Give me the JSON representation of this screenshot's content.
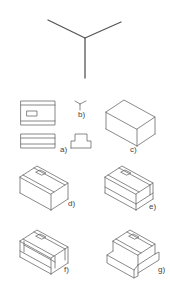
{
  "figure": {
    "axes_icon": "isometric-axes-icon",
    "panels": [
      {
        "id": "a",
        "label": "a)",
        "description": "orthographic views (top, front, side)"
      },
      {
        "id": "b",
        "label": "b)",
        "description": "isometric axes"
      },
      {
        "id": "c",
        "label": "c)",
        "description": "bounding box"
      },
      {
        "id": "d",
        "label": "d)",
        "description": "top features added"
      },
      {
        "id": "e",
        "label": "e)",
        "description": "step cut lines"
      },
      {
        "id": "f",
        "label": "f)",
        "description": "step construction"
      },
      {
        "id": "g",
        "label": "g)",
        "description": "finished isometric"
      }
    ]
  },
  "colors": {
    "line": "#6b6b6b",
    "background": "#ffffff"
  }
}
